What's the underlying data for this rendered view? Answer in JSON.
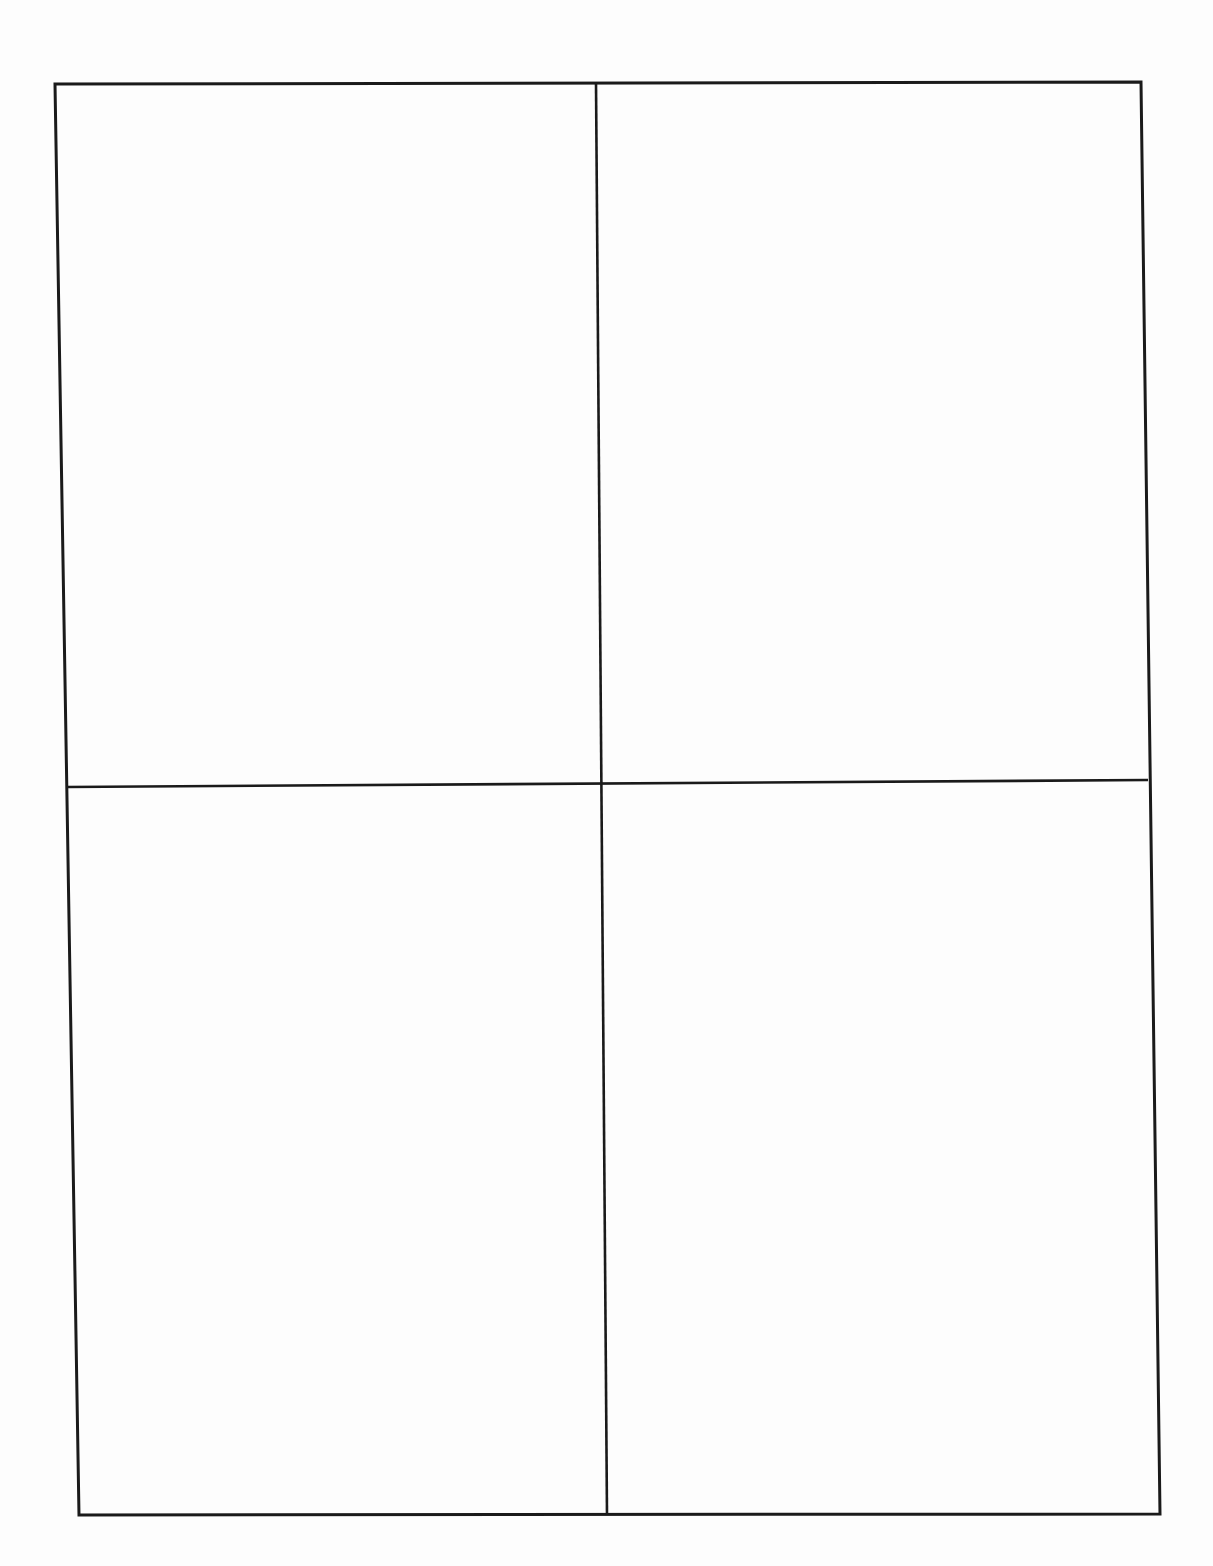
{
  "document": {
    "type": "blank-form",
    "layout": "2x2-grid",
    "stroke_color": "#1a1a1a",
    "background_color": "#fdfdfd",
    "grid": {
      "outer": {
        "top_left": [
          55,
          84
        ],
        "top_right": [
          1141,
          82
        ],
        "bottom_right": [
          1160,
          1514
        ],
        "bottom_left": [
          79,
          1515
        ]
      },
      "vertical_divider": {
        "top": [
          596,
          83
        ],
        "bottom": [
          607,
          1515
        ]
      },
      "horizontal_divider": {
        "left": [
          67,
          787
        ],
        "right": [
          1148,
          780
        ]
      }
    },
    "cells": [
      {
        "id": "top-left",
        "text": ""
      },
      {
        "id": "top-right",
        "text": ""
      },
      {
        "id": "bottom-left",
        "text": ""
      },
      {
        "id": "bottom-right",
        "text": ""
      }
    ]
  }
}
